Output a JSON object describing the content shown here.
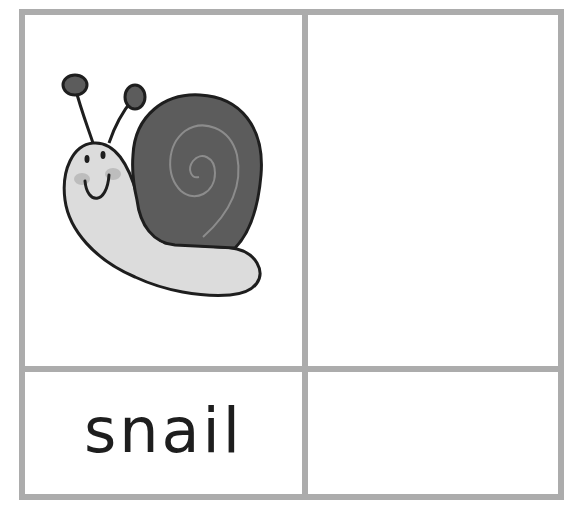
{
  "card": {
    "word": "snail",
    "picture": "snail-illustration",
    "colors": {
      "grid_border": "#acacac",
      "shell": "#5c5c5c",
      "body": "#dcdcdc",
      "outline": "#1e1e1e",
      "spiral": "#8c8c8c",
      "cheek": "#bdbdbd"
    }
  }
}
